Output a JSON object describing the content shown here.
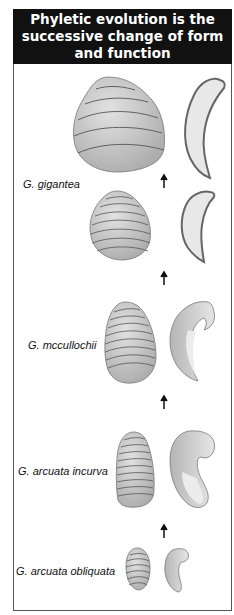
{
  "title": "Phyletic evolution is the successive change of form and function",
  "colors": {
    "header_bg": "#111111",
    "header_text": "#ffffff",
    "shell_fill": "#c8c8c8",
    "shell_light": "#e4e4e4",
    "shell_line": "#555555",
    "arrow": "#111111"
  },
  "species": [
    {
      "name": "G. gigantea"
    },
    {
      "name": "G. mccullochii"
    },
    {
      "name": "G. arcuata incurva"
    },
    {
      "name": "G. arcuata obliquata"
    }
  ],
  "icons": {
    "arrow": "up-arrow"
  }
}
